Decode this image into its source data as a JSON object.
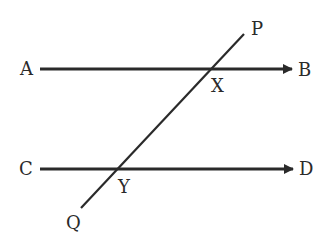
{
  "diagram": {
    "colors": {
      "stroke": "#2a2a2a",
      "background": "#ffffff"
    },
    "lines": [
      {
        "id": "AB",
        "from": "A",
        "to": "B",
        "arrow": true
      },
      {
        "id": "CD",
        "from": "C",
        "to": "D",
        "arrow": true
      },
      {
        "id": "PQ",
        "from": "P",
        "to": "Q",
        "arrow": false
      }
    ],
    "labels": {
      "A": "A",
      "B": "B",
      "C": "C",
      "D": "D",
      "P": "P",
      "Q": "Q",
      "X": "X",
      "Y": "Y"
    },
    "intersections": [
      {
        "point": "X",
        "lines": [
          "AB",
          "PQ"
        ]
      },
      {
        "point": "Y",
        "lines": [
          "CD",
          "PQ"
        ]
      }
    ]
  }
}
